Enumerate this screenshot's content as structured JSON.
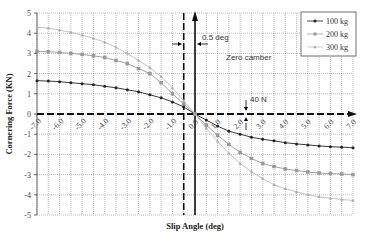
{
  "chart_data": {
    "type": "line",
    "title": "",
    "xlabel": "Slip Angle (deg)",
    "ylabel": "Cornering  Force (KN)",
    "xlim": [
      -7,
      7
    ],
    "ylim": [
      -5,
      5
    ],
    "grid": true,
    "legend_position": "top-right",
    "x_tick_labels": [
      "-7.0",
      "-6.0",
      "-5.0",
      "-4.0",
      "-3.0",
      "-2.0",
      "-1.0",
      "0.0",
      "1.0",
      "2.0",
      "3.0",
      "4.0",
      "5.0",
      "6.0",
      "7.0"
    ],
    "y_tick_labels": [
      "5",
      "4",
      "3",
      "2",
      "1",
      "0",
      "-1",
      "-2",
      "-3",
      "-4",
      "-5"
    ],
    "x": [
      -7.0,
      -6.5,
      -6.0,
      -5.5,
      -5.0,
      -4.5,
      -4.0,
      -3.5,
      -3.0,
      -2.5,
      -2.0,
      -1.5,
      -1.0,
      -0.5,
      0.0,
      0.5,
      1.0,
      1.5,
      2.0,
      2.5,
      3.0,
      3.5,
      4.0,
      4.5,
      5.0,
      5.5,
      6.0,
      6.5,
      7.0
    ],
    "series": [
      {
        "name": "100 kg",
        "color": "#222222",
        "marker": "diamond",
        "values": [
          1.65,
          1.63,
          1.6,
          1.55,
          1.5,
          1.45,
          1.37,
          1.3,
          1.2,
          1.1,
          0.95,
          0.8,
          0.6,
          0.35,
          0.0,
          -0.3,
          -0.6,
          -0.85,
          -1.0,
          -1.15,
          -1.25,
          -1.33,
          -1.42,
          -1.48,
          -1.53,
          -1.58,
          -1.62,
          -1.64,
          -1.67
        ]
      },
      {
        "name": "200 kg",
        "color": "#999999",
        "marker": "square",
        "values": [
          3.1,
          3.08,
          3.05,
          3.0,
          2.95,
          2.88,
          2.8,
          2.65,
          2.5,
          2.25,
          2.0,
          1.55,
          1.0,
          0.5,
          0.0,
          -0.55,
          -1.05,
          -1.5,
          -1.9,
          -2.2,
          -2.45,
          -2.6,
          -2.72,
          -2.8,
          -2.87,
          -2.92,
          -2.95,
          -2.97,
          -3.0
        ]
      },
      {
        "name": "300 kg",
        "color": "#bbbbbb",
        "marker": "triangle",
        "values": [
          4.3,
          4.25,
          4.15,
          4.05,
          3.9,
          3.75,
          3.55,
          3.3,
          3.0,
          2.65,
          2.3,
          1.85,
          1.3,
          0.65,
          0.0,
          -0.7,
          -1.35,
          -1.95,
          -2.45,
          -2.85,
          -3.2,
          -3.5,
          -3.7,
          -3.85,
          -4.0,
          -4.1,
          -4.17,
          -4.23,
          -4.28
        ]
      }
    ],
    "annotations": [
      {
        "text": "0.5 deg",
        "description": "offset between zero-slip axis and dashed vertical line"
      },
      {
        "text": "Zero camber"
      },
      {
        "text": "40 N",
        "description": "offset between horizontal dashed line and zero"
      }
    ]
  },
  "labels": {
    "xlabel": "Slip Angle (deg)",
    "ylabel": "Cornering  Force (KN)",
    "anno_deg": "0.5 deg",
    "anno_camber": "Zero camber",
    "anno_force": "40 N",
    "legend": [
      "100 kg",
      "200 kg",
      "300 kg"
    ]
  }
}
